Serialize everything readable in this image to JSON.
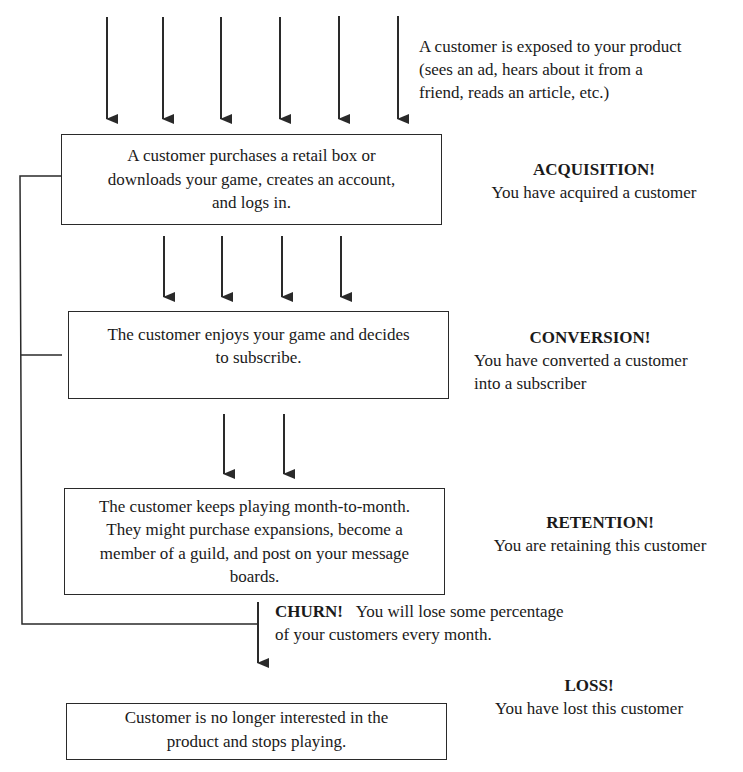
{
  "diagram": {
    "intro": {
      "lines": [
        "A customer is exposed to your product",
        "(sees an ad, hears about it from a",
        "friend, reads an article, etc.)"
      ]
    },
    "stages": [
      {
        "box_lines": [
          "A customer purchases a retail box or",
          "downloads your game, creates an account,",
          "and logs in."
        ],
        "heading": "ACQUISITION!",
        "desc_lines": [
          "You have acquired a customer"
        ]
      },
      {
        "box_lines": [
          "The customer enjoys your game and decides",
          "to subscribe."
        ],
        "heading": "CONVERSION!",
        "desc_lines": [
          "You have converted a customer",
          "into a subscriber"
        ]
      },
      {
        "box_lines": [
          "The customer keeps playing month-to-month.",
          "They might purchase expansions, become a",
          "member of a guild, and post on your message",
          "boards."
        ],
        "heading": "RETENTION!",
        "desc_lines": [
          "You are retaining this customer"
        ]
      },
      {
        "box_lines": [
          "Customer is no longer interested in the",
          "product and stops playing."
        ],
        "heading": "LOSS!",
        "desc_lines": [
          "You have lost this customer"
        ]
      }
    ],
    "churn": {
      "heading": "CHURN!",
      "line1": "You will lose some percentage",
      "line2": "of your customers every month."
    },
    "arrow_counts": [
      6,
      4,
      2,
      1
    ],
    "colors": {
      "line": "#2a2a2a",
      "background": "#ffffff",
      "text": "#1a1a1a"
    }
  }
}
